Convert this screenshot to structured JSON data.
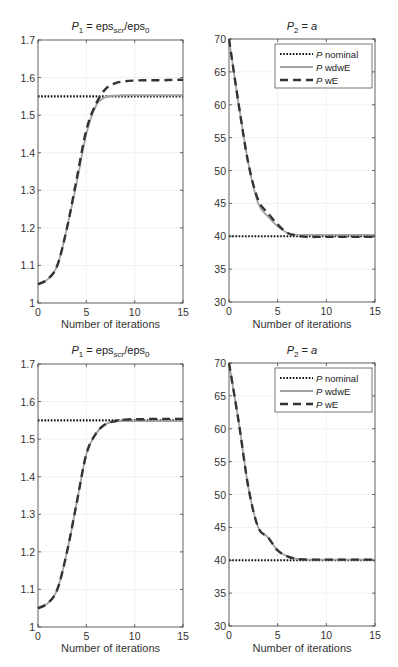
{
  "chart_data": [
    {
      "id": "top-left",
      "type": "line",
      "title": "P_1 = eps_scr/eps_0",
      "title_parts": {
        "main": "P",
        "main_sub": "1",
        "eq": " = eps",
        "eq_sub": "scr",
        "slash": "/eps",
        "slash_sub": "0"
      },
      "xlabel": "Number of iterations",
      "ylabel": "",
      "xlim": [
        0,
        15
      ],
      "ylim": [
        1,
        1.7
      ],
      "xticks": [
        0,
        5,
        10,
        15
      ],
      "yticks": [
        1,
        1.1,
        1.2,
        1.3,
        1.4,
        1.5,
        1.6,
        1.7
      ],
      "ytick_labels": [
        "1",
        "1.1",
        "1.2",
        "1.3",
        "1.4",
        "1.5",
        "1.6",
        "1.7"
      ],
      "grid": true,
      "legend": false,
      "x": [
        0,
        1,
        2,
        3,
        4,
        5,
        6,
        7,
        8,
        9,
        10,
        11,
        12,
        13,
        14,
        15
      ],
      "series": [
        {
          "name": "P nominal",
          "style": "dotted",
          "color": "#111111",
          "values": [
            1.55,
            1.55,
            1.55,
            1.55,
            1.55,
            1.55,
            1.55,
            1.55,
            1.55,
            1.55,
            1.55,
            1.55,
            1.55,
            1.55,
            1.55,
            1.55
          ]
        },
        {
          "name": "P wdwE",
          "style": "solid",
          "color": "#a0a0a0",
          "values": [
            1.05,
            1.063,
            1.1,
            1.2,
            1.32,
            1.45,
            1.525,
            1.548,
            1.552,
            1.553,
            1.553,
            1.553,
            1.553,
            1.553,
            1.553,
            1.553
          ]
        },
        {
          "name": "P wE",
          "style": "dashed",
          "color": "#333333",
          "values": [
            1.05,
            1.063,
            1.1,
            1.2,
            1.33,
            1.46,
            1.53,
            1.57,
            1.585,
            1.59,
            1.592,
            1.593,
            1.593,
            1.593,
            1.594,
            1.594
          ]
        }
      ]
    },
    {
      "id": "top-right",
      "type": "line",
      "title": "P_2 = a",
      "title_parts": {
        "main": "P",
        "main_sub": "2",
        "eq": " = ",
        "var": "a"
      },
      "xlabel": "Number of iterations",
      "ylabel": "",
      "xlim": [
        0,
        15
      ],
      "ylim": [
        30,
        70
      ],
      "xticks": [
        0,
        5,
        10,
        15
      ],
      "yticks": [
        30,
        35,
        40,
        45,
        50,
        55,
        60,
        65,
        70
      ],
      "grid": true,
      "legend": true,
      "legend_position": "upper right",
      "x": [
        0,
        1,
        2,
        3,
        4,
        5,
        6,
        7,
        8,
        9,
        10,
        11,
        12,
        13,
        14,
        15
      ],
      "series": [
        {
          "name": "P nominal",
          "style": "dotted",
          "color": "#111111",
          "values": [
            40,
            40,
            40,
            40,
            40,
            40,
            40,
            40,
            40,
            40,
            40,
            40,
            40,
            40,
            40,
            40
          ]
        },
        {
          "name": "P wdwE",
          "style": "solid",
          "color": "#a0a0a0",
          "values": [
            70,
            60,
            51,
            45,
            43,
            41.5,
            40.5,
            40.2,
            40.2,
            40.2,
            40.2,
            40.2,
            40.2,
            40.2,
            40.2,
            40.2
          ]
        },
        {
          "name": "P wE",
          "style": "dashed",
          "color": "#333333",
          "values": [
            70,
            60,
            51,
            45.5,
            43.5,
            41.8,
            40.5,
            40.1,
            39.9,
            39.9,
            39.9,
            39.9,
            39.9,
            39.9,
            39.9,
            39.9
          ]
        }
      ]
    },
    {
      "id": "bottom-left",
      "type": "line",
      "title": "P_1 = eps_scr/eps_0",
      "title_parts": {
        "main": "P",
        "main_sub": "1",
        "eq": " = eps",
        "eq_sub": "scr",
        "slash": "/eps",
        "slash_sub": "0"
      },
      "xlabel": "Number of iterations",
      "ylabel": "",
      "xlim": [
        0,
        15
      ],
      "ylim": [
        1,
        1.7
      ],
      "xticks": [
        0,
        5,
        10,
        15
      ],
      "yticks": [
        1,
        1.1,
        1.2,
        1.3,
        1.4,
        1.5,
        1.6,
        1.7
      ],
      "ytick_labels": [
        "1",
        "1.1",
        "1.2",
        "1.3",
        "1.4",
        "1.5",
        "1.6",
        "1.7"
      ],
      "grid": true,
      "legend": false,
      "x": [
        0,
        1,
        2,
        3,
        4,
        5,
        6,
        7,
        8,
        9,
        10,
        11,
        12,
        13,
        14,
        15
      ],
      "series": [
        {
          "name": "P nominal",
          "style": "dotted",
          "color": "#111111",
          "values": [
            1.55,
            1.55,
            1.55,
            1.55,
            1.55,
            1.55,
            1.55,
            1.55,
            1.55,
            1.55,
            1.55,
            1.55,
            1.55,
            1.55,
            1.55,
            1.55
          ]
        },
        {
          "name": "P wdwE",
          "style": "solid",
          "color": "#a0a0a0",
          "values": [
            1.05,
            1.063,
            1.1,
            1.2,
            1.33,
            1.46,
            1.515,
            1.54,
            1.547,
            1.548,
            1.548,
            1.548,
            1.548,
            1.548,
            1.548,
            1.548
          ]
        },
        {
          "name": "P wE",
          "style": "dashed",
          "color": "#333333",
          "values": [
            1.05,
            1.063,
            1.1,
            1.2,
            1.33,
            1.46,
            1.515,
            1.54,
            1.548,
            1.552,
            1.553,
            1.553,
            1.554,
            1.554,
            1.554,
            1.554
          ]
        }
      ]
    },
    {
      "id": "bottom-right",
      "type": "line",
      "title": "P_2 = a",
      "title_parts": {
        "main": "P",
        "main_sub": "2",
        "eq": " = ",
        "var": "a"
      },
      "xlabel": "Number of iterations",
      "ylabel": "",
      "xlim": [
        0,
        15
      ],
      "ylim": [
        30,
        70
      ],
      "xticks": [
        0,
        5,
        10,
        15
      ],
      "yticks": [
        30,
        35,
        40,
        45,
        50,
        55,
        60,
        65,
        70
      ],
      "grid": true,
      "legend": true,
      "legend_position": "upper right",
      "x": [
        0,
        1,
        2,
        3,
        4,
        5,
        6,
        7,
        8,
        9,
        10,
        11,
        12,
        13,
        14,
        15
      ],
      "series": [
        {
          "name": "P nominal",
          "style": "dotted",
          "color": "#111111",
          "values": [
            40,
            40,
            40,
            40,
            40,
            40,
            40,
            40,
            40,
            40,
            40,
            40,
            40,
            40,
            40,
            40
          ]
        },
        {
          "name": "P wdwE",
          "style": "solid",
          "color": "#a0a0a0",
          "values": [
            70,
            61,
            51,
            45,
            43.5,
            41.5,
            40.6,
            40.2,
            40.1,
            40.1,
            40.1,
            40.1,
            40.1,
            40.1,
            40.1,
            40.1
          ]
        },
        {
          "name": "P wE",
          "style": "dashed",
          "color": "#333333",
          "values": [
            70,
            61,
            51,
            45,
            43.5,
            41.5,
            40.6,
            40.2,
            40.1,
            40.1,
            40.1,
            40.1,
            40.1,
            40.1,
            40.1,
            40.1
          ]
        }
      ]
    }
  ],
  "legend": {
    "entries": [
      {
        "italic": "P",
        "text": " nominal",
        "style": "dotted"
      },
      {
        "italic": "P",
        "text": " wdwE",
        "style": "solid"
      },
      {
        "italic": "P",
        "text": " wE",
        "style": "dashed"
      }
    ]
  },
  "layout": {
    "panels": [
      {
        "x0": 38,
        "x1": 183,
        "y_top": 40,
        "y_bottom": 303,
        "title_y": 30,
        "xlabel_y": 328
      },
      {
        "x0": 229,
        "x1": 375,
        "y_top": 39,
        "y_bottom": 302,
        "title_y": 30,
        "xlabel_y": 328
      },
      {
        "x0": 38,
        "x1": 183,
        "y_top": 364,
        "y_bottom": 627,
        "title_y": 354,
        "xlabel_y": 652
      },
      {
        "x0": 229,
        "x1": 375,
        "y_top": 363,
        "y_bottom": 626,
        "title_y": 354,
        "xlabel_y": 652
      }
    ]
  }
}
